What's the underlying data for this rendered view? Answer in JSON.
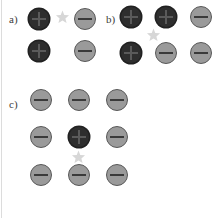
{
  "figure": {
    "background_color": "#ffffff",
    "width": 222,
    "height": 218
  },
  "colors": {
    "plus_fill": "#2e2e2e",
    "plus_glyph": "#5a5a5a",
    "minus_fill": "#9a9a9a",
    "minus_ring": "#585858",
    "minus_glyph": "#3a3a3a",
    "star_fill": "#d7d7d7",
    "label_color": "#3b3b3b",
    "edge_rule": "#dcdcdc"
  },
  "panels": [
    {
      "id": "a",
      "label": "a)",
      "label_x": 9,
      "label_y": 14,
      "rows": 2,
      "cols": 2,
      "nodes": [
        {
          "name": "node-a-r1c1",
          "charge": "plus",
          "symbol": "+",
          "x": 28,
          "y": 8
        },
        {
          "name": "node-a-r1c2",
          "charge": "minus",
          "symbol": "−",
          "x": 74,
          "y": 8
        },
        {
          "name": "node-a-r2c1",
          "charge": "plus",
          "symbol": "+",
          "x": 28,
          "y": 40
        },
        {
          "name": "node-a-r2c2",
          "charge": "minus",
          "symbol": "−",
          "x": 74,
          "y": 40
        }
      ],
      "stars": [
        {
          "name": "star-a-1",
          "x": 55,
          "y": 10
        }
      ]
    },
    {
      "id": "b",
      "label": "b)",
      "label_x": 106,
      "label_y": 14,
      "rows": 2,
      "cols": 3,
      "nodes": [
        {
          "name": "node-b-r1c1",
          "charge": "plus",
          "symbol": "+",
          "x": 120,
          "y": 6
        },
        {
          "name": "node-b-r1c2",
          "charge": "plus",
          "symbol": "+",
          "x": 155,
          "y": 6
        },
        {
          "name": "node-b-r1c3",
          "charge": "minus",
          "symbol": "−",
          "x": 190,
          "y": 6
        },
        {
          "name": "node-b-r2c1",
          "charge": "plus",
          "symbol": "+",
          "x": 120,
          "y": 42
        },
        {
          "name": "node-b-r2c2",
          "charge": "minus",
          "symbol": "−",
          "x": 155,
          "y": 42
        },
        {
          "name": "node-b-r2c3",
          "charge": "minus",
          "symbol": "−",
          "x": 190,
          "y": 42
        }
      ],
      "stars": [
        {
          "name": "star-b-1",
          "x": 146,
          "y": 28
        }
      ]
    },
    {
      "id": "c",
      "label": "c)",
      "label_x": 9,
      "label_y": 99,
      "rows": 3,
      "cols": 3,
      "nodes": [
        {
          "name": "node-c-r1c1",
          "charge": "minus",
          "symbol": "−",
          "x": 30,
          "y": 89
        },
        {
          "name": "node-c-r1c2",
          "charge": "minus",
          "symbol": "−",
          "x": 68,
          "y": 89
        },
        {
          "name": "node-c-r1c3",
          "charge": "minus",
          "symbol": "−",
          "x": 106,
          "y": 89
        },
        {
          "name": "node-c-r2c1",
          "charge": "minus",
          "symbol": "−",
          "x": 30,
          "y": 126
        },
        {
          "name": "node-c-r2c2",
          "charge": "plus",
          "symbol": "+",
          "x": 68,
          "y": 126
        },
        {
          "name": "node-c-r2c3",
          "charge": "minus",
          "symbol": "−",
          "x": 106,
          "y": 126
        },
        {
          "name": "node-c-r3c1",
          "charge": "minus",
          "symbol": "−",
          "x": 30,
          "y": 164
        },
        {
          "name": "node-c-r3c2",
          "charge": "minus",
          "symbol": "−",
          "x": 68,
          "y": 164
        },
        {
          "name": "node-c-r3c3",
          "charge": "minus",
          "symbol": "−",
          "x": 106,
          "y": 164
        }
      ],
      "stars": [
        {
          "name": "star-c-1",
          "x": 71,
          "y": 150
        }
      ]
    }
  ]
}
